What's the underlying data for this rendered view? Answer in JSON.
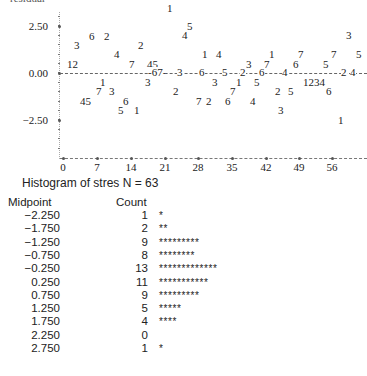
{
  "chart_data": [
    {
      "type": "scatter",
      "title": "",
      "ylabel": "residual",
      "xlabel": "",
      "ylim": [
        -4.0,
        3.5
      ],
      "xlim": [
        0,
        63
      ],
      "y_ticks": [
        "2.50",
        "0.00",
        "-2.50"
      ],
      "x_ticks": [
        "0",
        "7",
        "14",
        "21",
        "28",
        "35",
        "42",
        "49",
        "56"
      ],
      "reference_line": 0.0,
      "grid": false,
      "points_note": "Characters plotted are digit labels 1-7 marking residuals over observation index",
      "points": [
        {
          "label": "12",
          "x": 1.5,
          "y": 0.5
        },
        {
          "label": "3",
          "x": 3,
          "y": 1.6
        },
        {
          "label": "6",
          "x": 6,
          "y": 2.0
        },
        {
          "label": "2",
          "x": 8,
          "y": 2.0
        },
        {
          "label": "1",
          "x": 8,
          "y": -0.5
        },
        {
          "label": "7",
          "x": 7.5,
          "y": -0.8
        },
        {
          "label": "3",
          "x": 10,
          "y": -0.8
        },
        {
          "label": "45",
          "x": 5,
          "y": -1.3
        },
        {
          "label": "4",
          "x": 11.5,
          "y": 1.1
        },
        {
          "label": "6",
          "x": 13,
          "y": -1.3
        },
        {
          "label": "5",
          "x": 12.5,
          "y": -1.7
        },
        {
          "label": "1",
          "x": 15,
          "y": -1.6
        },
        {
          "label": "2",
          "x": 17.5,
          "y": 1.5
        },
        {
          "label": "7",
          "x": 15.5,
          "y": 0.6
        },
        {
          "label": "45",
          "x": 19,
          "y": 0.6
        },
        {
          "label": "3",
          "x": 18,
          "y": -0.4
        },
        {
          "label": "67",
          "x": 20.5,
          "y": 0.05
        },
        {
          "label": "1",
          "x": 23.5,
          "y": 3.1
        },
        {
          "label": "5",
          "x": 26,
          "y": 2.3
        },
        {
          "label": "4",
          "x": 25,
          "y": 2.0
        },
        {
          "label": "2",
          "x": 22,
          "y": -0.9
        },
        {
          "label": "3",
          "x": 25,
          "y": 0.0
        },
        {
          "label": "1",
          "x": 28,
          "y": 1.0
        },
        {
          "label": "4",
          "x": 30,
          "y": 1.0
        },
        {
          "label": "6",
          "x": 29.5,
          "y": 0.0
        },
        {
          "label": "7",
          "x": 29,
          "y": -1.1
        },
        {
          "label": "2",
          "x": 30.5,
          "y": -1.1
        },
        {
          "label": "3",
          "x": 32.5,
          "y": -0.4
        },
        {
          "label": "6",
          "x": 35.5,
          "y": -1.1
        },
        {
          "label": "5",
          "x": 34.5,
          "y": 0.0
        },
        {
          "label": "7",
          "x": 36.5,
          "y": -0.8
        },
        {
          "label": "1",
          "x": 37,
          "y": -0.4
        },
        {
          "label": "3",
          "x": 37.5,
          "y": 0.6
        },
        {
          "label": "2",
          "x": 39.5,
          "y": 0.0
        },
        {
          "label": "4",
          "x": 41,
          "y": -1.1
        },
        {
          "label": "7",
          "x": 43,
          "y": 0.6
        },
        {
          "label": "5",
          "x": 41.5,
          "y": -0.4
        },
        {
          "label": "1",
          "x": 44,
          "y": 1.0
        },
        {
          "label": "6",
          "x": 43.5,
          "y": 0.0
        },
        {
          "label": "2",
          "x": 46,
          "y": -0.9
        },
        {
          "label": "5",
          "x": 48.5,
          "y": -0.9
        },
        {
          "label": "3",
          "x": 47.5,
          "y": -1.6
        },
        {
          "label": "4",
          "x": 48,
          "y": 0.0
        },
        {
          "label": "6",
          "x": 50,
          "y": 0.6
        },
        {
          "label": "7",
          "x": 51,
          "y": 1.0
        },
        {
          "label": "1234",
          "x": 53.5,
          "y": -0.4
        },
        {
          "label": "6",
          "x": 55.5,
          "y": -0.9
        },
        {
          "label": "5",
          "x": 56,
          "y": 0.6
        },
        {
          "label": "7",
          "x": 57.5,
          "y": 1.0
        },
        {
          "label": "1",
          "x": 57.5,
          "y": -2.2
        },
        {
          "label": "2",
          "x": 60,
          "y": 0.0
        },
        {
          "label": "4",
          "x": 61.5,
          "y": 0.0
        },
        {
          "label": "3",
          "x": 62.5,
          "y": 1.9
        },
        {
          "label": "5",
          "x": 63,
          "y": 1.0
        }
      ]
    },
    {
      "type": "table",
      "title": "Histogram of stres N = 63",
      "columns": [
        "Midpoint",
        "Count"
      ],
      "categories": [
        "-2.250",
        "-1.750",
        "-1.250",
        "-0.750",
        "-0.250",
        "0.250",
        "0.750",
        "1.250",
        "1.750",
        "2.250",
        "2.750"
      ],
      "values": [
        1,
        2,
        9,
        8,
        13,
        11,
        9,
        5,
        4,
        0,
        1
      ],
      "bar_char": "*"
    }
  ],
  "plot": {
    "ylabel_partial": "residual",
    "y_labels": [
      {
        "text": "2.50",
        "top": 20
      },
      {
        "text": "0.00",
        "top": 67
      },
      {
        "text": "−2.50",
        "top": 114
      }
    ],
    "x_labels": [
      {
        "text": "0",
        "left": 53
      },
      {
        "text": "7",
        "left": 87
      },
      {
        "text": "14",
        "left": 121
      },
      {
        "text": "21",
        "left": 155
      },
      {
        "text": "28",
        "left": 188
      },
      {
        "text": "35",
        "left": 222
      },
      {
        "text": "42",
        "left": 256
      },
      {
        "text": "49",
        "left": 289
      },
      {
        "text": "56",
        "left": 322
      }
    ],
    "glyphs": [
      {
        "t": "1",
        "x": 167,
        "y": 3
      },
      {
        "t": "5",
        "x": 187,
        "y": 21
      },
      {
        "t": "4",
        "x": 182,
        "y": 30
      },
      {
        "t": "3",
        "x": 346,
        "y": 30
      },
      {
        "t": "6",
        "x": 89,
        "y": 31
      },
      {
        "t": "2",
        "x": 104,
        "y": 31
      },
      {
        "t": "3",
        "x": 74,
        "y": 40
      },
      {
        "t": "2",
        "x": 138,
        "y": 40
      },
      {
        "t": "4",
        "x": 114,
        "y": 49
      },
      {
        "t": "1",
        "x": 202,
        "y": 49
      },
      {
        "t": "4",
        "x": 216,
        "y": 49
      },
      {
        "t": "1",
        "x": 269,
        "y": 49
      },
      {
        "t": "7",
        "x": 298,
        "y": 49
      },
      {
        "t": "7",
        "x": 331,
        "y": 49
      },
      {
        "t": "5",
        "x": 356,
        "y": 49
      },
      {
        "t": "12",
        "x": 67,
        "y": 59
      },
      {
        "t": "7",
        "x": 129,
        "y": 59
      },
      {
        "t": "45",
        "x": 147,
        "y": 59
      },
      {
        "t": "3",
        "x": 246,
        "y": 59
      },
      {
        "t": "7",
        "x": 264,
        "y": 59
      },
      {
        "t": "6",
        "x": 293,
        "y": 59
      },
      {
        "t": "5",
        "x": 323,
        "y": 59
      },
      {
        "t": "1",
        "x": 100,
        "y": 77
      },
      {
        "t": "3",
        "x": 145,
        "y": 77
      },
      {
        "t": "3",
        "x": 212,
        "y": 77
      },
      {
        "t": "1",
        "x": 236,
        "y": 77
      },
      {
        "t": "5",
        "x": 254,
        "y": 77
      },
      {
        "t": "1234",
        "x": 303,
        "y": 77
      },
      {
        "t": "7",
        "x": 96,
        "y": 86
      },
      {
        "t": "3",
        "x": 109,
        "y": 86
      },
      {
        "t": "2",
        "x": 173,
        "y": 86
      },
      {
        "t": "7",
        "x": 230,
        "y": 86
      },
      {
        "t": "2",
        "x": 275,
        "y": 86
      },
      {
        "t": "5",
        "x": 288,
        "y": 86
      },
      {
        "t": "6",
        "x": 326,
        "y": 86
      },
      {
        "t": "45",
        "x": 80,
        "y": 96
      },
      {
        "t": "6",
        "x": 123,
        "y": 96
      },
      {
        "t": "7",
        "x": 196,
        "y": 96
      },
      {
        "t": "2",
        "x": 206,
        "y": 96
      },
      {
        "t": "6",
        "x": 225,
        "y": 96
      },
      {
        "t": "4",
        "x": 250,
        "y": 96
      },
      {
        "t": "5",
        "x": 118,
        "y": 105
      },
      {
        "t": "1",
        "x": 134,
        "y": 105
      },
      {
        "t": "3",
        "x": 278,
        "y": 105
      },
      {
        "t": "1",
        "x": 338,
        "y": 115
      }
    ],
    "zero_line_text": "-67--3--6------5----2----6------4------------------2-4-"
  },
  "histogram": {
    "title": "Histogram of stres N = 63",
    "header_midpoint": "Midpoint",
    "header_count": "Count",
    "rows": [
      {
        "mid": "−2.250",
        "count": "1",
        "bar": "*"
      },
      {
        "mid": "−1.750",
        "count": "2",
        "bar": "**"
      },
      {
        "mid": "−1.250",
        "count": "9",
        "bar": "*********"
      },
      {
        "mid": "−0.750",
        "count": "8",
        "bar": "********"
      },
      {
        "mid": "−0.250",
        "count": "13",
        "bar": "*************"
      },
      {
        "mid": "0.250",
        "count": "11",
        "bar": "***********"
      },
      {
        "mid": "0.750",
        "count": "9",
        "bar": "*********"
      },
      {
        "mid": "1.250",
        "count": "5",
        "bar": "*****"
      },
      {
        "mid": "1.750",
        "count": "4",
        "bar": "****"
      },
      {
        "mid": "2.250",
        "count": "0",
        "bar": ""
      },
      {
        "mid": "2.750",
        "count": "1",
        "bar": "*"
      }
    ]
  }
}
